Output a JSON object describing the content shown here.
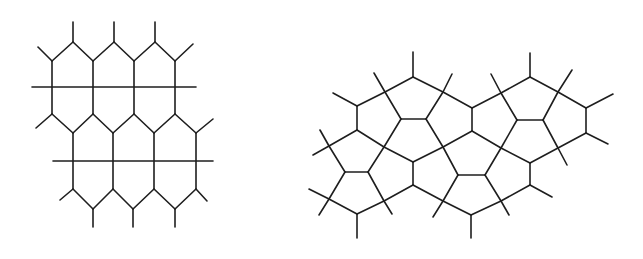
{
  "figures": [
    {
      "id": "elongated-hexagon-tiling",
      "description": "Tiling of elongated hexagons crossed by horizontal lines, with dangling edge stubs",
      "rows": 2,
      "cells_per_row": 3
    },
    {
      "id": "cairo-pentagonal-tiling",
      "description": "Pentagonal (Cairo-type) tiling with dangling edge stubs"
    }
  ],
  "style": {
    "stroke_color": "#1e1e1e",
    "background": "#ffffff"
  }
}
